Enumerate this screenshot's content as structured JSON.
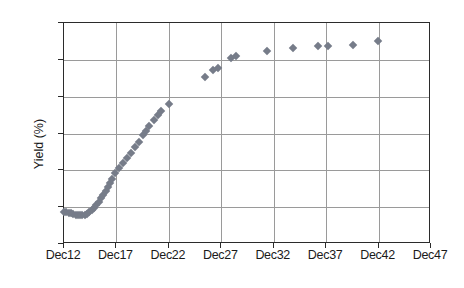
{
  "chart": {
    "type": "scatter",
    "title": "",
    "ylabel": "Yield (%)",
    "xlabel": "",
    "marker_color": "#767c89",
    "grid_color": "#9a9a9a",
    "axis_color": "#2b2b2b",
    "background": "#ffffff"
  },
  "yaxis": {
    "min": -0.5,
    "max": 2.5,
    "ticks": [
      2.5,
      2.0,
      1.5,
      1.0,
      0.5,
      0.0,
      -0.5
    ],
    "tick_labels": [
      "2.5",
      "2.0",
      "1.5",
      "1.0",
      "0.5",
      "0.0",
      "-0.5"
    ],
    "title": "Yield (%)"
  },
  "xaxis": {
    "ticks": [
      12,
      17,
      22,
      27,
      32,
      37,
      42,
      47
    ],
    "tick_labels": [
      "Dec12",
      "Dec17",
      "Dec22",
      "Dec27",
      "Dec32",
      "Dec37",
      "Dec42",
      "Dec47"
    ],
    "min": 12,
    "max": 47
  },
  "chart_data": {
    "type": "scatter",
    "title": "",
    "xlabel": "",
    "ylabel": "Yield (%)",
    "xlim": [
      12,
      47
    ],
    "ylim": [
      -0.5,
      2.5
    ],
    "grid": true,
    "legend": null,
    "x_tick_labels": [
      "Dec12",
      "Dec17",
      "Dec22",
      "Dec27",
      "Dec32",
      "Dec37",
      "Dec42",
      "Dec47"
    ],
    "x_ticks": [
      12,
      17,
      22,
      27,
      32,
      37,
      42,
      47
    ],
    "y_ticks": [
      -0.5,
      0.0,
      0.5,
      1.0,
      1.5,
      2.0,
      2.5
    ],
    "series": [
      {
        "name": "Yield curve",
        "marker": "diamond",
        "color": "#767c89",
        "points": [
          [
            12.0,
            -0.07
          ],
          [
            12.22,
            -0.07
          ],
          [
            12.44,
            -0.08
          ],
          [
            12.66,
            -0.08
          ],
          [
            12.88,
            -0.09
          ],
          [
            13.1,
            -0.1
          ],
          [
            13.32,
            -0.11
          ],
          [
            13.54,
            -0.11
          ],
          [
            13.76,
            -0.11
          ],
          [
            13.98,
            -0.1
          ],
          [
            14.2,
            -0.09
          ],
          [
            14.42,
            -0.07
          ],
          [
            14.64,
            -0.04
          ],
          [
            14.86,
            -0.01
          ],
          [
            15.08,
            0.03
          ],
          [
            15.3,
            0.07
          ],
          [
            15.52,
            0.12
          ],
          [
            15.74,
            0.17
          ],
          [
            15.96,
            0.22
          ],
          [
            16.18,
            0.27
          ],
          [
            16.4,
            0.33
          ],
          [
            16.62,
            0.38
          ],
          [
            16.84,
            0.46
          ],
          [
            17.2,
            0.53
          ],
          [
            17.6,
            0.6
          ],
          [
            18.0,
            0.67
          ],
          [
            18.4,
            0.74
          ],
          [
            18.8,
            0.81
          ],
          [
            19.2,
            0.88
          ],
          [
            19.55,
            0.98
          ],
          [
            19.85,
            1.04
          ],
          [
            20.15,
            1.1
          ],
          [
            20.55,
            1.18
          ],
          [
            20.95,
            1.25
          ],
          [
            21.25,
            1.3
          ],
          [
            22.0,
            1.4
          ],
          [
            25.4,
            1.77
          ],
          [
            26.2,
            1.86
          ],
          [
            26.7,
            1.89
          ],
          [
            27.9,
            2.02
          ],
          [
            28.45,
            2.05
          ],
          [
            31.4,
            2.12
          ],
          [
            33.8,
            2.16
          ],
          [
            36.2,
            2.19
          ],
          [
            37.2,
            2.19
          ],
          [
            39.6,
            2.2
          ],
          [
            41.9,
            2.25
          ]
        ]
      }
    ]
  }
}
